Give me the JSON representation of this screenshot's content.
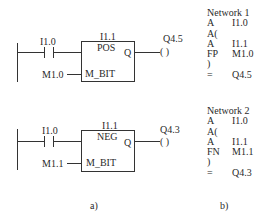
{
  "ladder": {
    "networks": [
      {
        "contact_label": "I1.0",
        "box_address": "I1.1",
        "box_function": "POS",
        "box_output_pin": "Q",
        "box_input_pin": "M_BIT",
        "m_bit_operand": "M1.0",
        "coil_label": "Q4.5",
        "coil_symbol": "( )"
      },
      {
        "contact_label": "I1.0",
        "box_address": "I1.1",
        "box_function": "NEG",
        "box_output_pin": "Q",
        "box_input_pin": "M_BIT",
        "m_bit_operand": "M1.1",
        "coil_label": "Q4.3",
        "coil_symbol": "( )"
      }
    ],
    "caption": "a)"
  },
  "stl": {
    "networks": [
      {
        "title": "Network  1",
        "lines": [
          {
            "op": "A",
            "operand": "I1.0"
          },
          {
            "op": "A(",
            "operand": ""
          },
          {
            "op": "A",
            "operand": "I1.1"
          },
          {
            "op": "FP",
            "operand": "M1.0"
          },
          {
            "op": ")",
            "operand": ""
          },
          {
            "op": "=",
            "operand": "Q4.5"
          }
        ]
      },
      {
        "title": "Network  2",
        "lines": [
          {
            "op": "A",
            "operand": "I1.0"
          },
          {
            "op": "A(",
            "operand": ""
          },
          {
            "op": "A",
            "operand": "I1.1"
          },
          {
            "op": "FN",
            "operand": "M1.1"
          },
          {
            "op": ")",
            "operand": ""
          },
          {
            "op": "=",
            "operand": "Q4.3"
          }
        ]
      }
    ],
    "caption": "b)"
  }
}
